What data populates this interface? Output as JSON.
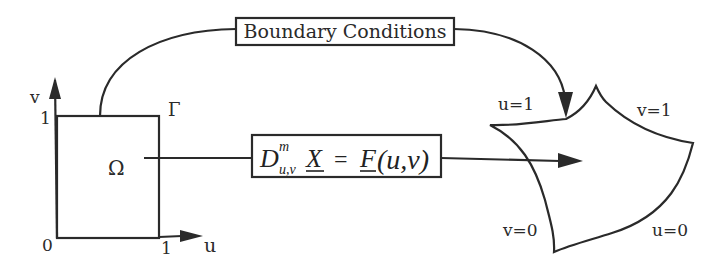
{
  "domain_labels": {
    "axis_v": "v",
    "axis_u": "u",
    "tick_v1": "1",
    "tick_u1": "1",
    "origin": "0",
    "boundary": "Γ",
    "domain": "Ω"
  },
  "boundary_box": {
    "label": "Boundary Conditions"
  },
  "equation_box": {
    "D": "D",
    "sup": "m",
    "sub": "u,v",
    "X": "X",
    "eq": "=",
    "F": "F",
    "args": "(u,v)"
  },
  "surface_labels": {
    "top_left": "u=1",
    "top_right": "v=1",
    "bottom_left": "v=0",
    "bottom_right": "u=0"
  }
}
